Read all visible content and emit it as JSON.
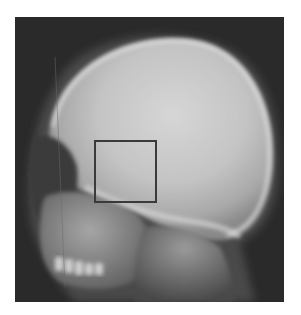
{
  "figure": {
    "colors": {
      "background": "#ffffff",
      "film_dark": "#2a2a2a",
      "bone_light": "#d8d8d8",
      "roi_border": "#3a3a3a"
    },
    "roi": {
      "shape": "square",
      "region": "sella / middle cranial base"
    }
  }
}
